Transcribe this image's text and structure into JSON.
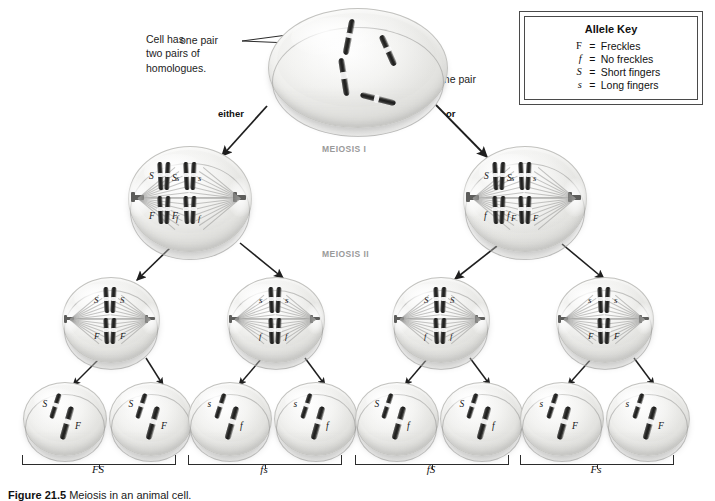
{
  "figure": {
    "caption_number": "Figure 21.5",
    "caption_text": "Meiosis in an animal cell."
  },
  "annotations": {
    "cell_note": "Cell has\ntwo pairs of\nhomologues.",
    "one_pair_top": "one pair",
    "one_pair_right": "one pair",
    "either": "either",
    "or": "or"
  },
  "stages": {
    "meiosis_1": "MEIOSIS I",
    "meiosis_2": "MEIOSIS II"
  },
  "allele_key": {
    "title": "Allele Key",
    "rows": [
      {
        "symbol": "F",
        "equals": "=",
        "description": "Freckles",
        "italic": false
      },
      {
        "symbol": "f",
        "equals": "=",
        "description": "No freckles",
        "italic": true
      },
      {
        "symbol": "S",
        "equals": "=",
        "description": "Short fingers",
        "italic": true
      },
      {
        "symbol": "s",
        "equals": "=",
        "description": "Long fingers",
        "italic": true
      }
    ]
  },
  "meiosis_i_cells": [
    {
      "id": "left",
      "top_pair": [
        "S",
        "S",
        "s",
        "s"
      ],
      "bottom_pair": [
        "F",
        "F",
        "f",
        "f"
      ]
    },
    {
      "id": "right",
      "top_pair": [
        "S",
        "S",
        "s",
        "s"
      ],
      "bottom_pair": [
        "f",
        "f",
        "F",
        "F"
      ]
    }
  ],
  "meiosis_ii_cells": [
    {
      "id": "c1",
      "top": [
        "S",
        "S"
      ],
      "bottom": [
        "F",
        "F"
      ]
    },
    {
      "id": "c2",
      "top": [
        "s",
        "s"
      ],
      "bottom": [
        "f",
        "f"
      ]
    },
    {
      "id": "c3",
      "top": [
        "S",
        "S"
      ],
      "bottom": [
        "f",
        "f"
      ]
    },
    {
      "id": "c4",
      "top": [
        "s",
        "s"
      ],
      "bottom": [
        "F",
        "F"
      ]
    }
  ],
  "gametes": [
    {
      "id": "g1",
      "short": "S",
      "long": "F"
    },
    {
      "id": "g2",
      "short": "S",
      "long": "F"
    },
    {
      "id": "g3",
      "short": "s",
      "long": "f"
    },
    {
      "id": "g4",
      "short": "s",
      "long": "f"
    },
    {
      "id": "g5",
      "short": "S",
      "long": "f"
    },
    {
      "id": "g6",
      "short": "S",
      "long": "f"
    },
    {
      "id": "g7",
      "short": "s",
      "long": "F"
    },
    {
      "id": "g8",
      "short": "s",
      "long": "F"
    }
  ],
  "gamete_groups": [
    {
      "id": "grp1",
      "label": "FS"
    },
    {
      "id": "grp2",
      "label": "fs"
    },
    {
      "id": "grp3",
      "label": "fS"
    },
    {
      "id": "grp4",
      "label": "Fs"
    }
  ],
  "colors": {
    "background": "#ffffff",
    "cell_fill": "#e8e8e5",
    "chromosome": "#242423",
    "text": "#1a1a1a",
    "stage_label": "#9a9a9a",
    "key_border": "#4a4a4a"
  }
}
